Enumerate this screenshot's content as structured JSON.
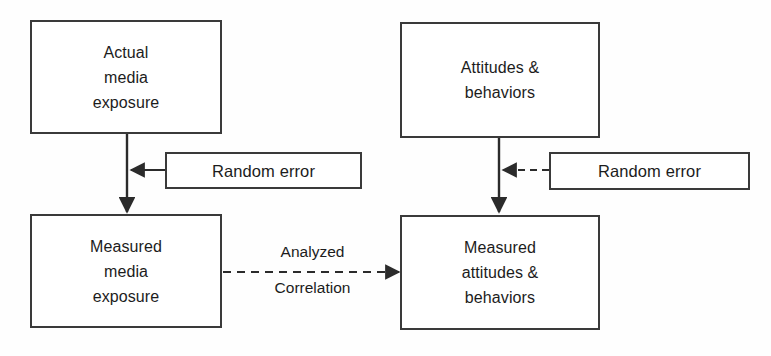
{
  "diagram": {
    "background_color": "#fefefe",
    "line_color": "#3a3a3a",
    "text_color": "#1c1c1c",
    "nodes": {
      "actual_media_exposure": "Actual\nmedia\nexposure",
      "attitudes_behaviors": "Attitudes &\nbehaviors",
      "random_error_left": "Random error",
      "random_error_right": "Random error",
      "measured_media_exposure": "Measured\nmedia\nexposure",
      "measured_attitudes_behaviors": "Measured\nattitudes &\nbehaviors"
    },
    "edge_labels": {
      "analyzed": "Analyzed",
      "correlation": "Correlation"
    }
  }
}
